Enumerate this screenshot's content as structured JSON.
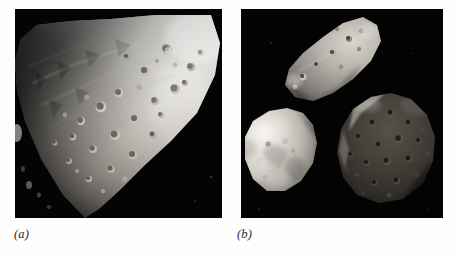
{
  "figure": {
    "background_color": "#fefefe",
    "panel_background_color": "#000000",
    "panels": [
      {
        "key": "a",
        "label": "(a)",
        "name": "panel-a",
        "subject": "large close-up of a heavily cratered elongated asteroid (Gaspra)",
        "object_count": 1,
        "objects": [
          {
            "name": "asteroid-gaspra-large",
            "description": "irregular elongated wedge-shaped asteroid lit from upper right, terminator running along upper-left limb, surface covered in small craters",
            "brightness": "bright grey, strongly illuminated",
            "crater_count_visible": 46
          }
        ]
      },
      {
        "key": "b",
        "label": "(b)",
        "name": "panel-b",
        "subject": "three small solar-system bodies shown at comparable scale",
        "object_count": 3,
        "objects": [
          {
            "name": "asteroid-gaspra-small",
            "position": "upper-centre",
            "description": "elongated angular asteroid tilted down-left, bright rough surface, crescent of shadow at lower edge",
            "brightness": "medium grey"
          },
          {
            "name": "moon-deimos",
            "position": "lower-left",
            "description": "rounded, smooth-looking small moon, brightly lit on the left with blurred soft limb at right",
            "brightness": "bright grey"
          },
          {
            "name": "moon-phobos",
            "position": "right, lower half",
            "description": "large roughly spherical heavily cratered moon, very dark with faint bright rim along the upper-left edge",
            "brightness": "very dark grey"
          }
        ]
      }
    ]
  }
}
